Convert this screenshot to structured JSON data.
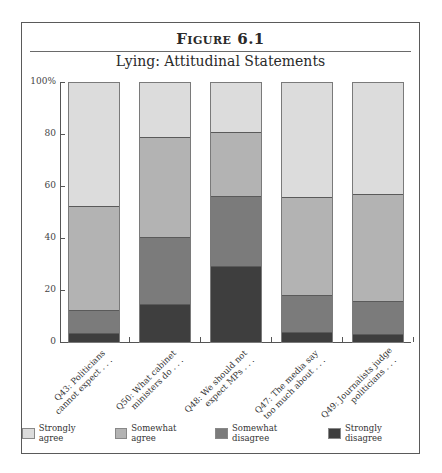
{
  "figure": {
    "label": "Figure 6.1",
    "title": "Lying: Attitudinal Statements"
  },
  "chart_data": {
    "type": "bar",
    "stacked": true,
    "title": "Lying: Attitudinal Statements",
    "xlabel": "",
    "ylabel": "",
    "ylim": [
      0,
      100
    ],
    "yticks": [
      "0",
      "20",
      "40",
      "60",
      "80",
      "100%"
    ],
    "grid": false,
    "legend_position": "bottom",
    "categories": [
      "Q43: Politicians cannot expect . . .",
      "Q50: What cabinet ministers do . . .",
      "Q48: We should not expect MPs . . .",
      "Q47: The media say too much about . . .",
      "Q49: Journalists judge politicians . . ."
    ],
    "series": [
      {
        "name": "Strongly disagree",
        "color": "#3e3e3e",
        "values": [
          3.5,
          14.5,
          29.5,
          4.0,
          3.0
        ]
      },
      {
        "name": "Somewhat disagree",
        "color": "#7b7b7b",
        "values": [
          9.0,
          26.0,
          27.0,
          14.0,
          13.0
        ]
      },
      {
        "name": "Somewhat agree",
        "color": "#b3b3b3",
        "values": [
          40.0,
          38.5,
          24.5,
          38.0,
          41.0
        ]
      },
      {
        "name": "Strongly agree",
        "color": "#dcdcdc",
        "values": [
          47.5,
          21.0,
          19.0,
          44.0,
          43.0
        ]
      }
    ]
  },
  "axis": {
    "ticks": [
      {
        "label": "0",
        "value": 0
      },
      {
        "label": "20",
        "value": 20
      },
      {
        "label": "40",
        "value": 40
      },
      {
        "label": "60",
        "value": 60
      },
      {
        "label": "80",
        "value": 80
      },
      {
        "label": "100%",
        "value": 100
      }
    ]
  },
  "xlabels": [
    {
      "line1": "Q43: Politicians",
      "line2": "cannot expect . . ."
    },
    {
      "line1": "Q50: What cabinet",
      "line2": "ministers do . . ."
    },
    {
      "line1": "Q48: We should not",
      "line2": "expect MPs . . ."
    },
    {
      "line1": "Q47: The media say",
      "line2": "too much about . . ."
    },
    {
      "line1": "Q49: Journalists judge",
      "line2": "politicians . . ."
    }
  ],
  "legend": [
    {
      "label": "Strongly agree",
      "color": "#dcdcdc"
    },
    {
      "label": "Somewhat agree",
      "color": "#b3b3b3"
    },
    {
      "label": "Somewhat disagree",
      "color": "#7b7b7b"
    },
    {
      "label": "Strongly disagree",
      "color": "#3e3e3e"
    }
  ]
}
